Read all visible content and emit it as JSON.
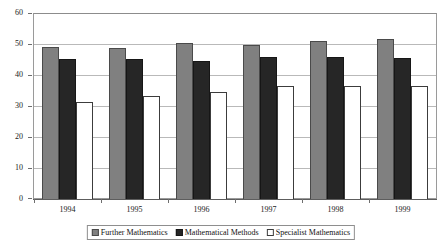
{
  "chart_data": {
    "type": "bar",
    "title": "",
    "subtitle": "",
    "xlabel": "",
    "ylabel": "",
    "categories": [
      "1994",
      "1995",
      "1996",
      "1997",
      "1998",
      "1999"
    ],
    "series": [
      {
        "name": "Further Mathematics",
        "swatch": "s0",
        "color": "#808080",
        "values": [
          49.3,
          49,
          50.7,
          49.8,
          51.4,
          52
        ]
      },
      {
        "name": "Mathematical Methods",
        "swatch": "s1",
        "color": "#262626",
        "values": [
          45.5,
          45.3,
          44.8,
          45.9,
          45.9,
          45.8
        ]
      },
      {
        "name": "Specialist Mathematics",
        "swatch": "s2",
        "color": "#ffffff",
        "values": [
          31.6,
          33.5,
          34.6,
          36.6,
          36.6,
          36.8
        ]
      }
    ],
    "ylim": [
      0,
      60
    ],
    "yticks": [
      0,
      10,
      20,
      30,
      40,
      50,
      60
    ],
    "ytick_labels": [
      "0",
      "10",
      "20",
      "30",
      "40",
      "50",
      "60"
    ],
    "grid": true,
    "legend_position": "bottom",
    "axis_color": "#808080",
    "grid_color": "#b9b9b9"
  },
  "legend": {
    "entries": [
      {
        "label": "Further Mathematics"
      },
      {
        "label": "Mathematical Methods"
      },
      {
        "label": "Specialist Mathematics"
      }
    ]
  }
}
